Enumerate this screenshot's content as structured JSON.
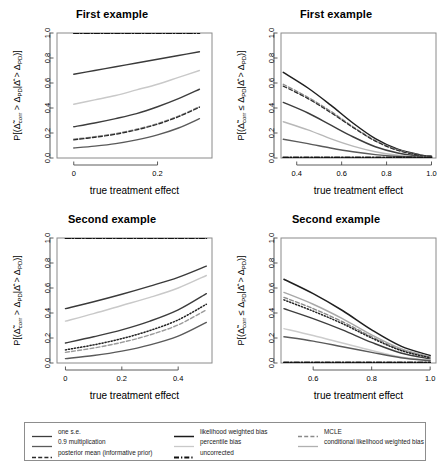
{
  "figure": {
    "width": 448,
    "height": 475,
    "background": "#ffffff"
  },
  "panels": [
    {
      "id": "top-left",
      "title": "First example",
      "xlabel": "true treatment effect",
      "ylabel_main": "P[(Δ̃corr > ΔPD|Δ̂ > ΔPD)]",
      "xticks": [
        "0",
        "0.2"
      ],
      "xtick_values": [
        0,
        0.2
      ],
      "yticks": [
        "0.0",
        "0.2",
        "0.4",
        "0.6",
        "0.8",
        "1.0"
      ],
      "xlim": [
        -0.04,
        0.33
      ],
      "ylim": [
        0,
        1
      ]
    },
    {
      "id": "top-right",
      "title": "First example",
      "xlabel": "true treatment effect",
      "ylabel_main": "P[(Δ̃corr ≤ ΔPD|Δ̂ > ΔPD)]",
      "xticks": [
        "0.4",
        "0.6",
        "0.8",
        "1.0"
      ],
      "xtick_values": [
        0.4,
        0.6,
        0.8,
        1.0
      ],
      "yticks": [
        "0.0",
        "0.2",
        "0.4",
        "0.6",
        "0.8",
        "1.0"
      ],
      "xlim": [
        0.33,
        1.02
      ],
      "ylim": [
        0,
        1
      ]
    },
    {
      "id": "bottom-left",
      "title": "Second example",
      "xlabel": "true treatment effect",
      "ylabel_main": "P[(Δ̃corr > ΔPD|Δ̂ > ΔPD)]",
      "xticks": [
        "0",
        "0.2",
        "0.4"
      ],
      "xtick_values": [
        0,
        0.2,
        0.4
      ],
      "yticks": [
        "0.0",
        "0.2",
        "0.4",
        "0.6",
        "0.8",
        "1.0"
      ],
      "xlim": [
        -0.03,
        0.52
      ],
      "ylim": [
        0,
        1
      ]
    },
    {
      "id": "bottom-right",
      "title": "Second example",
      "xlabel": "true treatment effect",
      "ylabel_main": "P[(Δ̃corr ≤ ΔPD|Δ̂ > ΔPD)]",
      "xticks": [
        "0.6",
        "0.8",
        "1.0"
      ],
      "xtick_values": [
        0.6,
        0.8,
        1.0
      ],
      "yticks": [
        "0.0",
        "0.2",
        "0.4",
        "0.6",
        "0.8",
        "1.0"
      ],
      "xlim": [
        0.49,
        1.02
      ],
      "ylim": [
        0,
        1
      ]
    }
  ],
  "legend": {
    "columns": [
      {
        "items": [
          {
            "label": "one s.e.",
            "style": "solid",
            "color": "#3d3d3d",
            "width": 1.3
          },
          {
            "label": "0.9 multiplication",
            "style": "solid",
            "color": "#5a5a5a",
            "width": 1.3
          },
          {
            "label": "posterior mean (informative prior)",
            "style": "dashed",
            "color": "#2b2b2b",
            "width": 1.3
          }
        ]
      },
      {
        "items": [
          {
            "label": "likelihood weighted bias",
            "style": "solid",
            "color": "#1a1a1a",
            "width": 1.5
          },
          {
            "label": "percentile bias",
            "style": "solid",
            "color": "#c9c9c9",
            "width": 1.3
          },
          {
            "label": "uncorrected",
            "style": "dashdot",
            "color": "#111111",
            "width": 1.8
          }
        ]
      },
      {
        "items": [
          {
            "label": "MCLE",
            "style": "dashed",
            "color": "#8a8a8a",
            "width": 1.3
          },
          {
            "label": "conditional likelihood weighted bias",
            "style": "solid",
            "color": "#b0b0b0",
            "width": 1.3
          }
        ]
      }
    ]
  },
  "chart_data": {
    "type": "line",
    "panel_count": 4,
    "shared_xlabel": "true treatment effect",
    "series_names": [
      "one s.e.",
      "0.9 multiplication",
      "posterior mean (informative prior)",
      "likelihood weighted bias",
      "percentile bias",
      "uncorrected",
      "MCLE",
      "conditional likelihood weighted bias"
    ],
    "charts": [
      {
        "id": "top-left",
        "title": "First example",
        "xlabel": "true treatment effect",
        "ylabel": "P[(Δ̃corr > ΔPD|Δ̂ > ΔPD)]",
        "xlim": [
          -0.04,
          0.33
        ],
        "ylim": [
          0.0,
          1.0
        ],
        "grid": false,
        "x": [
          0.0,
          0.05,
          0.1,
          0.15,
          0.2,
          0.25,
          0.3
        ],
        "series": [
          {
            "name": "uncorrected",
            "style": "dashdot",
            "color": "#111111",
            "width": 1.8,
            "values": [
              1.0,
              1.0,
              1.0,
              1.0,
              1.0,
              1.0,
              1.0
            ]
          },
          {
            "name": "likelihood weighted bias",
            "style": "solid",
            "color": "#3a3a3a",
            "width": 1.4,
            "values": [
              0.67,
              0.7,
              0.73,
              0.76,
              0.79,
              0.82,
              0.85
            ]
          },
          {
            "name": "percentile bias",
            "style": "solid",
            "color": "#c9c9c9",
            "width": 1.4,
            "values": [
              0.43,
              0.465,
              0.5,
              0.545,
              0.59,
              0.645,
              0.7
            ]
          },
          {
            "name": "one s.e.",
            "style": "solid",
            "color": "#3d3d3d",
            "width": 1.4,
            "values": [
              0.25,
              0.28,
              0.315,
              0.355,
              0.41,
              0.475,
              0.55
            ]
          },
          {
            "name": "MCLE",
            "style": "dashed",
            "color": "#8a8a8a",
            "width": 1.4,
            "values": [
              0.15,
              0.17,
              0.195,
              0.23,
              0.275,
              0.335,
              0.41
            ]
          },
          {
            "name": "posterior mean (informative prior)",
            "style": "dashed",
            "color": "#2b2b2b",
            "width": 1.2,
            "values": [
              0.145,
              0.165,
              0.19,
              0.225,
              0.27,
              0.33,
              0.405
            ]
          },
          {
            "name": "0.9 multiplication",
            "style": "solid",
            "color": "#5a5a5a",
            "width": 1.4,
            "values": [
              0.08,
              0.095,
              0.115,
              0.145,
              0.185,
              0.24,
              0.315
            ]
          }
        ]
      },
      {
        "id": "top-right",
        "title": "First example",
        "xlabel": "true treatment effect",
        "ylabel": "P[(Δ̃corr ≤ ΔPD|Δ̂ > ΔPD)]",
        "xlim": [
          0.33,
          1.02
        ],
        "ylim": [
          0.0,
          1.0
        ],
        "grid": false,
        "x": [
          0.34,
          0.45,
          0.55,
          0.65,
          0.75,
          0.85,
          0.95,
          1.0
        ],
        "series": [
          {
            "name": "likelihood weighted bias",
            "style": "solid",
            "color": "#1f1f1f",
            "width": 1.5,
            "values": [
              0.685,
              0.56,
              0.425,
              0.28,
              0.155,
              0.07,
              0.025,
              0.015
            ]
          },
          {
            "name": "MCLE",
            "style": "dashed",
            "color": "#8a8a8a",
            "width": 1.4,
            "values": [
              0.59,
              0.485,
              0.375,
              0.25,
              0.14,
              0.065,
              0.022,
              0.014
            ]
          },
          {
            "name": "posterior mean (informative prior)",
            "style": "dashed",
            "color": "#2b2b2b",
            "width": 1.2,
            "values": [
              0.575,
              0.475,
              0.365,
              0.245,
              0.135,
              0.06,
              0.02,
              0.013
            ]
          },
          {
            "name": "one s.e.",
            "style": "solid",
            "color": "#3d3d3d",
            "width": 1.4,
            "values": [
              0.445,
              0.36,
              0.265,
              0.17,
              0.09,
              0.04,
              0.015,
              0.01
            ]
          },
          {
            "name": "conditional likelihood weighted bias",
            "style": "solid",
            "color": "#b8b8b8",
            "width": 1.4,
            "values": [
              0.29,
              0.225,
              0.155,
              0.095,
              0.05,
              0.022,
              0.008,
              0.005
            ]
          },
          {
            "name": "0.9 multiplication",
            "style": "solid",
            "color": "#5a5a5a",
            "width": 1.4,
            "values": [
              0.15,
              0.115,
              0.08,
              0.05,
              0.027,
              0.012,
              0.005,
              0.003
            ]
          },
          {
            "name": "uncorrected",
            "style": "dashdot",
            "color": "#111111",
            "width": 1.8,
            "values": [
              0.005,
              0.005,
              0.005,
              0.005,
              0.005,
              0.005,
              0.005,
              0.005
            ]
          }
        ]
      },
      {
        "id": "bottom-left",
        "title": "Second example",
        "xlabel": "true treatment effect",
        "ylabel": "P[(Δ̃corr > ΔPD|Δ̂ > ΔPD)]",
        "xlim": [
          -0.03,
          0.52
        ],
        "ylim": [
          0.0,
          1.0
        ],
        "grid": false,
        "x": [
          0.0,
          0.1,
          0.2,
          0.3,
          0.4,
          0.5
        ],
        "series": [
          {
            "name": "uncorrected",
            "style": "dashdot",
            "color": "#111111",
            "width": 1.8,
            "values": [
              1.0,
              1.0,
              1.0,
              1.0,
              1.0,
              1.0
            ]
          },
          {
            "name": "likelihood weighted bias",
            "style": "solid",
            "color": "#3a3a3a",
            "width": 1.4,
            "values": [
              0.435,
              0.49,
              0.55,
              0.615,
              0.685,
              0.775
            ]
          },
          {
            "name": "percentile bias",
            "style": "solid",
            "color": "#c9c9c9",
            "width": 1.4,
            "values": [
              0.335,
              0.395,
              0.46,
              0.525,
              0.6,
              0.7
            ]
          },
          {
            "name": "one s.e.",
            "style": "solid",
            "color": "#3d3d3d",
            "width": 1.4,
            "values": [
              0.16,
              0.21,
              0.265,
              0.335,
              0.425,
              0.555
            ]
          },
          {
            "name": "posterior mean (informative prior)",
            "style": "dotted",
            "color": "#222222",
            "width": 1.5,
            "values": [
              0.105,
              0.145,
              0.195,
              0.26,
              0.345,
              0.47
            ]
          },
          {
            "name": "MCLE",
            "style": "dashed",
            "color": "#9a9a9a",
            "width": 1.4,
            "values": [
              0.085,
              0.12,
              0.165,
              0.225,
              0.305,
              0.425
            ]
          },
          {
            "name": "0.9 multiplication",
            "style": "solid",
            "color": "#5a5a5a",
            "width": 1.4,
            "values": [
              0.035,
              0.06,
              0.095,
              0.145,
              0.215,
              0.325
            ]
          }
        ]
      },
      {
        "id": "bottom-right",
        "title": "Second example",
        "xlabel": "true treatment effect",
        "ylabel": "P[(Δ̃corr ≤ ΔPD|Δ̂ > ΔPD)]",
        "xlim": [
          0.49,
          1.02
        ],
        "ylim": [
          0.0,
          1.0
        ],
        "grid": false,
        "x": [
          0.5,
          0.6,
          0.7,
          0.8,
          0.9,
          1.0
        ],
        "series": [
          {
            "name": "likelihood weighted bias",
            "style": "solid",
            "color": "#1f1f1f",
            "width": 1.5,
            "values": [
              0.67,
              0.555,
              0.42,
              0.265,
              0.135,
              0.06
            ]
          },
          {
            "name": "conditional likelihood weighted bias",
            "style": "solid",
            "color": "#a8a8a8",
            "width": 1.4,
            "values": [
              0.565,
              0.47,
              0.355,
              0.225,
              0.115,
              0.05
            ]
          },
          {
            "name": "MCLE",
            "style": "dashed",
            "color": "#8a8a8a",
            "width": 1.4,
            "values": [
              0.525,
              0.435,
              0.33,
              0.21,
              0.105,
              0.045
            ]
          },
          {
            "name": "posterior mean (informative prior)",
            "style": "dotted",
            "color": "#222222",
            "width": 1.5,
            "values": [
              0.505,
              0.415,
              0.315,
              0.2,
              0.1,
              0.042
            ]
          },
          {
            "name": "one s.e.",
            "style": "solid",
            "color": "#3d3d3d",
            "width": 1.4,
            "values": [
              0.435,
              0.355,
              0.265,
              0.165,
              0.08,
              0.033
            ]
          },
          {
            "name": "percentile bias",
            "style": "solid",
            "color": "#cccccc",
            "width": 1.4,
            "values": [
              0.275,
              0.22,
              0.16,
              0.1,
              0.048,
              0.02
            ]
          },
          {
            "name": "0.9 multiplication",
            "style": "solid",
            "color": "#5a5a5a",
            "width": 1.4,
            "values": [
              0.21,
              0.175,
              0.13,
              0.085,
              0.042,
              0.018
            ]
          },
          {
            "name": "uncorrected",
            "style": "dashdot",
            "color": "#111111",
            "width": 1.8,
            "values": [
              0.005,
              0.005,
              0.005,
              0.005,
              0.005,
              0.005
            ]
          }
        ]
      }
    ]
  }
}
